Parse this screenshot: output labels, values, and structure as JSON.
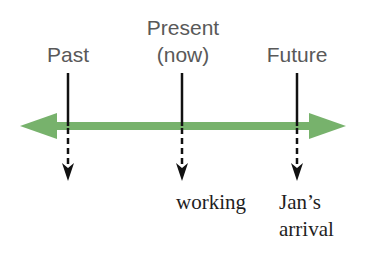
{
  "diagram": {
    "type": "timeline",
    "colors": {
      "timeline_arrow": "#77b26c",
      "marker_lines": "#111111",
      "top_labels": "#595959",
      "bottom_labels": "#1e1e1e",
      "background": "#ffffff"
    },
    "top_labels": {
      "past": "Past",
      "present_line1": "Present",
      "present_line2": "(now)",
      "future": "Future"
    },
    "bottom_labels": {
      "present": "working",
      "future_line1": "Jan’s",
      "future_line2": "arrival"
    },
    "markers": [
      {
        "name": "past",
        "x": 68
      },
      {
        "name": "present",
        "x": 182
      },
      {
        "name": "future",
        "x": 297
      }
    ]
  }
}
